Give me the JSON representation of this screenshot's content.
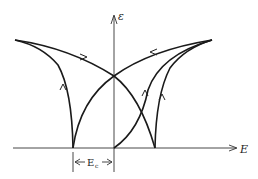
{
  "diagram": {
    "type": "butterfly-strain-loop",
    "y_axis_label": "ε",
    "x_axis_label": "E",
    "coercive_field_label": "E",
    "coercive_field_subscript": "c",
    "colors": {
      "curve": "#1a1a1a",
      "axis": "#333333",
      "background": "#ffffff"
    },
    "key_points": {
      "left_peak": [
        15,
        40
      ],
      "right_peak": [
        212,
        40
      ],
      "crossing": [
        114,
        76
      ],
      "left_cusp": [
        73,
        148
      ],
      "right_cusp": [
        155,
        148
      ],
      "origin": [
        114,
        148
      ]
    }
  }
}
